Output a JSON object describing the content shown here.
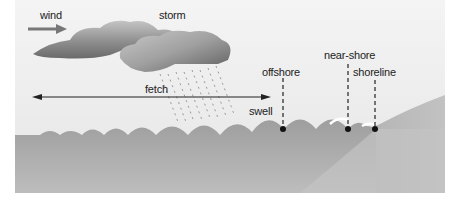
{
  "diagram": {
    "labels": {
      "wind": "wind",
      "storm": "storm",
      "fetch": "fetch",
      "swell": "swell",
      "offshore": "offshore",
      "near_shore": "near-shore",
      "shoreline": "shoreline"
    },
    "colors": {
      "sky": "#ebebeb",
      "sea": "#a8a8a8",
      "sea_deep": "#b4b4b4",
      "land": "#b8b8b8",
      "cloud_dark": "#6e6e6e",
      "cloud_light": "#cfcfcf",
      "wind_arrow": "#777777",
      "marker": "#111111",
      "border": "#ffffff"
    }
  }
}
